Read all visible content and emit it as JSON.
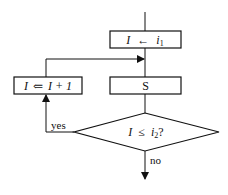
{
  "diagram": {
    "type": "flowchart",
    "nodes": {
      "init": {
        "var": "I",
        "arrow": "←",
        "rhs_base": "i",
        "rhs_sub": "1"
      },
      "increment": {
        "var": "I",
        "arrow": "⇐",
        "rhs": "I + 1"
      },
      "body": {
        "label": "S"
      },
      "decision": {
        "var": "I",
        "op": "≤",
        "rhs_base": "i",
        "rhs_sub": "2",
        "suffix": "?"
      }
    },
    "edges": {
      "yes_label": "yes",
      "no_label": "no"
    },
    "colors": {
      "stroke": "#111111",
      "background": "#ffffff"
    }
  }
}
